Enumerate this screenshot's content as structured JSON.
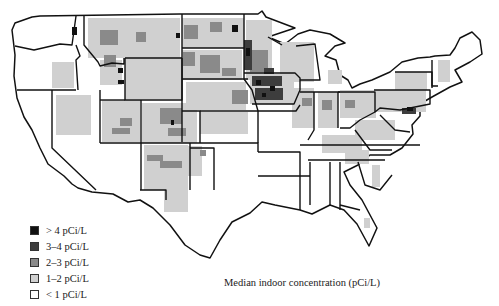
{
  "map": {
    "title": "Median indoor concentration (pCi/L)",
    "region": "Contiguous United States (county level)",
    "legend": {
      "items": [
        {
          "label": "> 4 pCi/L",
          "color": "#111111"
        },
        {
          "label": "3–4 pCi/L",
          "color": "#3d3d3d"
        },
        {
          "label": "2–3 pCi/L",
          "color": "#8a8a8a"
        },
        {
          "label": "1–2 pCi/L",
          "color": "#d0d0d0"
        },
        {
          "label": "< 1 pCi/L",
          "color": "#ffffff"
        }
      ]
    }
  },
  "colors": {
    "gt4": "#111111",
    "c34": "#3d3d3d",
    "c23": "#8a8a8a",
    "c12": "#d0d0d0",
    "lt1": "#ffffff",
    "border": "#111111"
  }
}
